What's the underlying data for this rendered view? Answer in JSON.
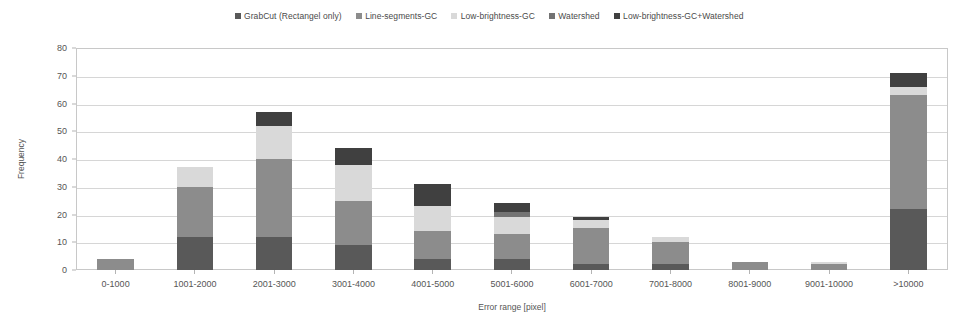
{
  "chart_data": {
    "type": "bar",
    "stacked": true,
    "title": "",
    "xlabel": "Error range [pixel]",
    "ylabel": "Frequency",
    "ylim": [
      0,
      80
    ],
    "ytick_step": 10,
    "yticks": [
      0,
      10,
      20,
      30,
      40,
      50,
      60,
      70,
      80
    ],
    "grid": true,
    "legend_position": "top-center",
    "categories": [
      "0-1000",
      "1001-2000",
      "2001-3000",
      "3001-4000",
      "4001-5000",
      "5001-6000",
      "6001-7000",
      "7001-8000",
      "8001-9000",
      "9001-10000",
      ">10000"
    ],
    "series": [
      {
        "name": "GrabCut (Rectangel only)",
        "color": "#595959",
        "values": [
          0,
          12,
          12,
          9,
          4,
          4,
          2,
          2,
          0,
          0,
          22
        ]
      },
      {
        "name": "Line-segments-GC",
        "color": "#8c8c8c",
        "values": [
          4,
          18,
          28,
          16,
          10,
          9,
          13,
          8,
          3,
          2,
          41
        ]
      },
      {
        "name": "Low-brightness-GC",
        "color": "#d9d9d9",
        "values": [
          0,
          7,
          12,
          13,
          9,
          6,
          3,
          2,
          0,
          1,
          3
        ]
      },
      {
        "name": "Watershed",
        "color": "#737373",
        "values": [
          0,
          0,
          0,
          0,
          0,
          2,
          0,
          0,
          0,
          0,
          0
        ]
      },
      {
        "name": "Low-brightness-GC+Watershed",
        "color": "#404040",
        "values": [
          0,
          0,
          5,
          6,
          8,
          3,
          1,
          0,
          0,
          0,
          5
        ]
      }
    ],
    "totals": [
      4,
      37,
      57,
      44,
      31,
      24,
      19,
      12,
      3,
      3,
      71
    ]
  }
}
